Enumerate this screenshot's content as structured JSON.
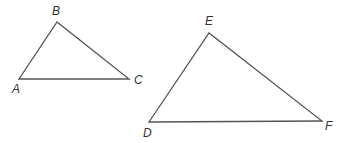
{
  "diagram": {
    "stroke_color": "#555555",
    "triangles": [
      {
        "name": "triangle-abc",
        "vertices": [
          {
            "label": "A",
            "x": 19,
            "y": 79,
            "lx": 12,
            "ly": 93
          },
          {
            "label": "B",
            "x": 57,
            "y": 22,
            "lx": 52,
            "ly": 15
          },
          {
            "label": "C",
            "x": 129,
            "y": 79,
            "lx": 134,
            "ly": 84
          }
        ]
      },
      {
        "name": "triangle-def",
        "vertices": [
          {
            "label": "D",
            "x": 149,
            "y": 122,
            "lx": 143,
            "ly": 137
          },
          {
            "label": "E",
            "x": 209,
            "y": 33,
            "lx": 205,
            "ly": 25
          },
          {
            "label": "F",
            "x": 322,
            "y": 121,
            "lx": 325,
            "ly": 130
          }
        ]
      }
    ]
  }
}
